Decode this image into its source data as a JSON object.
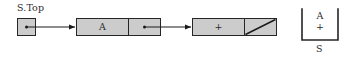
{
  "diagram": {
    "pointer": {
      "label": "S.Top",
      "box_name": "pointer-origin-box"
    },
    "nodes": [
      {
        "data": "A",
        "link": "pointer",
        "link_icon": "arrow-right-icon"
      },
      {
        "data": "+",
        "link": "null",
        "link_icon": "null-slash-icon"
      }
    ],
    "stack": {
      "label": "S",
      "items": [
        "A",
        "+"
      ],
      "top_item": "A"
    },
    "arrows": [
      {
        "from": "pointer-origin-box",
        "to": "node-1",
        "name": "arrow-ptr-to-node1"
      },
      {
        "from": "node-1-link",
        "to": "node-2",
        "name": "arrow-node1-to-node2"
      }
    ],
    "colors": {
      "cell_fill": "#cccccc",
      "stroke": "#262626",
      "text": "#2b2b2b",
      "background": "#ffffff"
    }
  }
}
